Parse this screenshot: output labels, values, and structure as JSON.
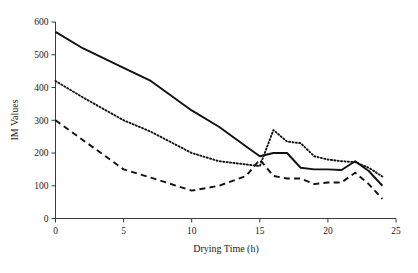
{
  "chart_data": {
    "type": "line",
    "title": "",
    "xlabel": "Drying Time (h)",
    "ylabel": "IM Values",
    "xlim": [
      0,
      25
    ],
    "ylim": [
      0,
      600
    ],
    "xticks": [
      0,
      5,
      10,
      15,
      20,
      25
    ],
    "yticks": [
      0,
      100,
      200,
      300,
      400,
      500,
      600
    ],
    "xtick_labels": [
      "0",
      "5",
      "10",
      "15",
      "20",
      "25"
    ],
    "ytick_labels": [
      "0",
      "100",
      "200",
      "300",
      "400",
      "500",
      "600"
    ],
    "grid": false,
    "legend": null,
    "legend_position": "none",
    "x": [
      0,
      2,
      5,
      7,
      10,
      12,
      14,
      15,
      16,
      17,
      18,
      19,
      20,
      21,
      22,
      23,
      24
    ],
    "series": [
      {
        "name": "solid-series",
        "style": "solid",
        "color": "#111111",
        "values": [
          570,
          520,
          460,
          420,
          330,
          280,
          220,
          190,
          200,
          200,
          155,
          150,
          150,
          148,
          175,
          145,
          100
        ]
      },
      {
        "name": "dotted-series",
        "style": "dotted",
        "color": "#111111",
        "values": [
          420,
          370,
          300,
          265,
          200,
          175,
          165,
          160,
          270,
          235,
          230,
          190,
          180,
          175,
          172,
          155,
          128
        ]
      },
      {
        "name": "dashed-series",
        "style": "dashed",
        "color": "#111111",
        "values": [
          300,
          240,
          150,
          125,
          85,
          100,
          130,
          180,
          130,
          122,
          122,
          105,
          110,
          110,
          140,
          105,
          60
        ]
      }
    ]
  }
}
